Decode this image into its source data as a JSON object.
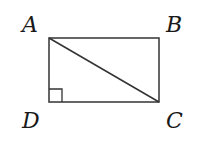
{
  "figure": {
    "type": "rectangle-with-diagonal",
    "vertices": {
      "A": {
        "label": "A",
        "x": 49,
        "y": 38
      },
      "B": {
        "label": "B",
        "x": 159,
        "y": 38
      },
      "C": {
        "label": "C",
        "x": 159,
        "y": 102
      },
      "D": {
        "label": "D",
        "x": 49,
        "y": 102
      }
    },
    "diagonal": "AC",
    "right_angle_marker": "D",
    "stroke_color": "#333333"
  }
}
